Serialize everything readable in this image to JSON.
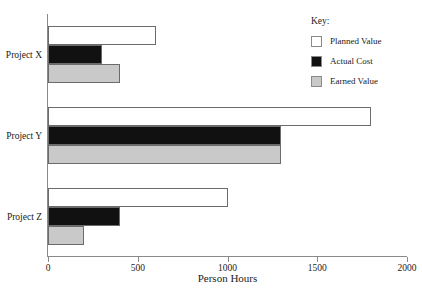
{
  "chart_data": {
    "type": "bar",
    "orientation": "horizontal",
    "title": "",
    "xlabel": "Person Hours",
    "ylabel": "",
    "xlim": [
      0,
      2000
    ],
    "xticks": [
      0,
      500,
      1000,
      1500,
      2000
    ],
    "xtick_labels": [
      "0",
      "500",
      "1000",
      "1500",
      "2000"
    ],
    "grid": false,
    "categories": [
      "Project X",
      "Project Y",
      "Project Z"
    ],
    "series": [
      {
        "name": "Planned Value",
        "color": "#ffffff",
        "values": [
          600,
          1800,
          1000
        ]
      },
      {
        "name": "Actual Cost",
        "color": "#111111",
        "values": [
          300,
          1300,
          400
        ]
      },
      {
        "name": "Earned Value",
        "color": "#c9c9c9",
        "values": [
          400,
          1300,
          200
        ]
      }
    ],
    "legend": {
      "position": "top-right",
      "title": "Key:",
      "entries": [
        "Planned Value",
        "Actual Cost",
        "Earned Value"
      ]
    }
  },
  "axis": {
    "x_title": "Person Hours"
  },
  "legend": {
    "title": "Key:",
    "items": [
      {
        "label": "Planned Value",
        "swatch": "planned"
      },
      {
        "label": "Actual Cost",
        "swatch": "actual"
      },
      {
        "label": "Earned Value",
        "swatch": "earned"
      }
    ]
  },
  "colors": {
    "planned": "#ffffff",
    "actual": "#111111",
    "earned": "#c9c9c9",
    "axis": "#8a8a8a",
    "text": "#1a1a1a"
  }
}
